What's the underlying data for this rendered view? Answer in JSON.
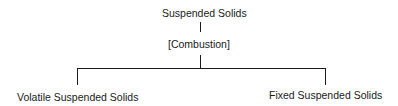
{
  "diagram": {
    "type": "tree",
    "root": {
      "label": "Suspended Solids"
    },
    "process": {
      "label": "[Combustion]"
    },
    "children": [
      {
        "label": "Volatile Suspended Solids"
      },
      {
        "label": "Fixed Suspended Solids"
      }
    ],
    "line_color": "#1a1a1a"
  }
}
